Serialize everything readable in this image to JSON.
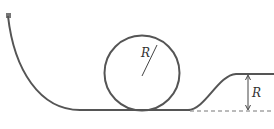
{
  "diagram": {
    "type": "physics-track-loop",
    "colors": {
      "track": "#555555",
      "line": "#444444",
      "dashed": "#777777",
      "background": "#ffffff"
    },
    "labels": {
      "loop_radius": "R",
      "step_height": "R"
    }
  }
}
